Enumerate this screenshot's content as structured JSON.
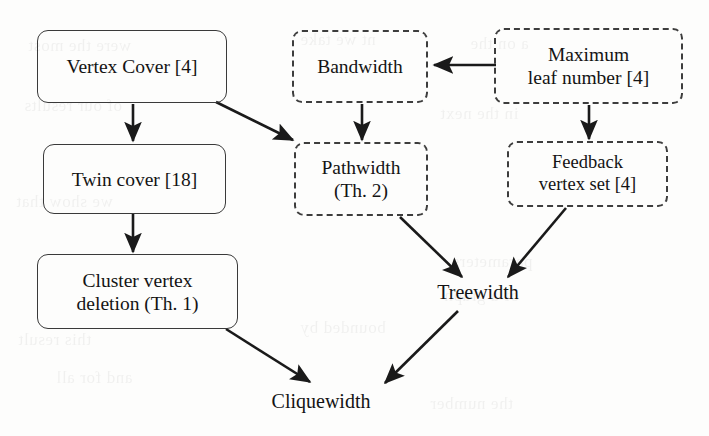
{
  "figure": {
    "type": "parameter-hierarchy-diagram",
    "background_color": "#fdfdfc",
    "ink_color": "#141414",
    "solid_border_color": "#3a3a3a",
    "dashed_border_color": "#3d3d3d"
  },
  "nodes": {
    "vertex_cover": {
      "label": "Vertex Cover [4]",
      "style": "solid"
    },
    "twin_cover": {
      "label": "Twin cover [18]",
      "style": "solid"
    },
    "cluster_vertex_deletion": {
      "label": "Cluster vertex\ndeletion (Th. 1)",
      "style": "solid"
    },
    "bandwidth": {
      "label": "Bandwidth",
      "style": "dashed"
    },
    "maximum_leaf_number": {
      "label": "Maximum\nleaf number [4]",
      "style": "dashed"
    },
    "pathwidth": {
      "label": "Pathwidth\n(Th. 2)",
      "style": "dashed"
    },
    "feedback_vertex_set": {
      "label": "Feedback\nvertex set [4]",
      "style": "dashed"
    },
    "treewidth": {
      "label": "Treewidth",
      "style": "plain"
    },
    "cliquewidth": {
      "label": "Cliquewidth",
      "style": "plain"
    }
  },
  "edges": [
    {
      "from": "vertex_cover",
      "to": "twin_cover",
      "shape": "vertical"
    },
    {
      "from": "vertex_cover",
      "to": "pathwidth",
      "shape": "diagonal"
    },
    {
      "from": "twin_cover",
      "to": "cluster_vertex_deletion",
      "shape": "vertical"
    },
    {
      "from": "cluster_vertex_deletion",
      "to": "cliquewidth",
      "shape": "diagonal"
    },
    {
      "from": "maximum_leaf_number",
      "to": "bandwidth",
      "shape": "horizontal"
    },
    {
      "from": "maximum_leaf_number",
      "to": "feedback_vertex_set",
      "shape": "vertical"
    },
    {
      "from": "bandwidth",
      "to": "pathwidth",
      "shape": "vertical"
    },
    {
      "from": "pathwidth",
      "to": "treewidth",
      "shape": "diagonal"
    },
    {
      "from": "feedback_vertex_set",
      "to": "treewidth",
      "shape": "diagonal"
    },
    {
      "from": "treewidth",
      "to": "cliquewidth",
      "shape": "diagonal"
    }
  ],
  "bleed_text": [
    {
      "text": "were the most"
    },
    {
      "text": "nt we take"
    },
    {
      "text": "a on the"
    },
    {
      "text": "of our results"
    },
    {
      "text": "in the next"
    },
    {
      "text": "we show that"
    },
    {
      "text": "parameters"
    },
    {
      "text": "of a graph"
    },
    {
      "text": "bounded by"
    },
    {
      "text": "this result"
    },
    {
      "text": "and for all"
    },
    {
      "text": "the number"
    }
  ]
}
